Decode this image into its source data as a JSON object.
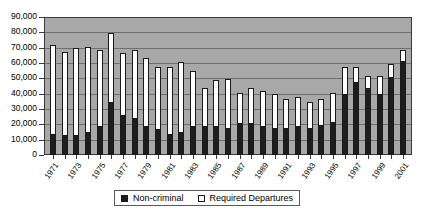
{
  "chart_data": {
    "type": "bar",
    "subtype": "stacked-column",
    "title": "",
    "xlabel": "",
    "ylabel": "",
    "ylim": [
      0,
      90000
    ],
    "ytick_labels": [
      "90,000",
      "80,000",
      "70,000",
      "60,000",
      "50,000",
      "40,000",
      "30,000",
      "20,000",
      "10,000",
      "0"
    ],
    "ytick_values": [
      90000,
      80000,
      70000,
      60000,
      50000,
      40000,
      30000,
      20000,
      10000,
      0
    ],
    "grid": true,
    "grid_axis": "y",
    "legend_position": "bottom",
    "plot_background": "#a8a8a8",
    "categories": [
      "1971",
      "1972",
      "1973",
      "1974",
      "1975",
      "1976",
      "1977",
      "1978",
      "1979",
      "1980",
      "1981",
      "1982",
      "1983",
      "1984",
      "1985",
      "1986",
      "1987",
      "1988",
      "1989",
      "1990",
      "1991",
      "1992",
      "1993",
      "1994",
      "1995",
      "1996",
      "1997",
      "1998",
      "1999",
      "2000",
      "2001"
    ],
    "xtick_labels_shown": [
      "1971",
      "1973",
      "1975",
      "1977",
      "1979",
      "1981",
      "1983",
      "1985",
      "1987",
      "1989",
      "1991",
      "1993",
      "1995",
      "1997",
      "1999",
      "2001"
    ],
    "series": [
      {
        "name": "Non-criminal",
        "color": "#1d1d1d",
        "values": [
          14000,
          13000,
          13000,
          15000,
          19000,
          35000,
          26000,
          24000,
          19000,
          17000,
          14000,
          15000,
          19000,
          19000,
          19000,
          18000,
          21000,
          21000,
          19000,
          18000,
          18000,
          19000,
          18000,
          20000,
          22000,
          40000,
          48000,
          44000,
          40000,
          51000,
          62000
        ]
      },
      {
        "name": "Required Departures",
        "color": "#ffffff",
        "values": [
          58000,
          55000,
          57000,
          56000,
          50000,
          45000,
          41000,
          45000,
          45000,
          41000,
          44000,
          46000,
          36000,
          25000,
          30000,
          32000,
          20000,
          23000,
          23000,
          22000,
          19000,
          19000,
          17000,
          17000,
          19000,
          18000,
          10000,
          8000,
          12000,
          9000,
          7000
        ]
      }
    ],
    "totals": [
      72000,
      68000,
      70000,
      71000,
      69000,
      80000,
      67000,
      69000,
      64000,
      58000,
      58000,
      61000,
      55000,
      44000,
      49000,
      50000,
      41000,
      44000,
      42000,
      40000,
      37000,
      38000,
      35000,
      37000,
      41000,
      58000,
      58000,
      52000,
      52000,
      60000,
      69000
    ]
  },
  "legend": {
    "items": [
      {
        "label": "Non-criminal",
        "swatch": "dark"
      },
      {
        "label": "Required Departures",
        "swatch": "light"
      }
    ]
  }
}
